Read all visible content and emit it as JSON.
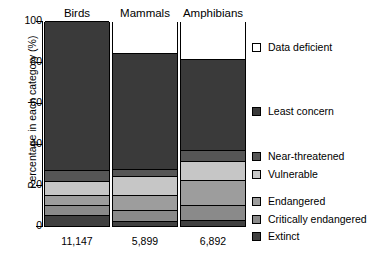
{
  "chart_data": {
    "type": "bar",
    "subtype": "stacked-percentage",
    "title": "",
    "xlabel": "",
    "ylabel": "Percentage in each category (%)",
    "ylim": [
      0,
      100
    ],
    "yticks": [
      "0",
      "20",
      "40",
      "60",
      "80",
      "100"
    ],
    "grid": false,
    "legend_position": "right",
    "categories": [
      "Birds",
      "Mammals",
      "Amphibians"
    ],
    "sample_sizes": [
      "11,147",
      "5,899",
      "6,892"
    ],
    "series": [
      {
        "name": "Data deficient",
        "color": "#ffffff",
        "values": [
          0.0,
          15.7,
          18.6
        ]
      },
      {
        "name": "Least concern",
        "color": "#3a3a3a",
        "values": [
          72.5,
          56.4,
          44.1
        ]
      },
      {
        "name": "Near-threatened",
        "color": "#565656",
        "values": [
          5.4,
          3.4,
          5.4
        ]
      },
      {
        "name": "Vulnerable",
        "color": "#c6c6c6",
        "values": [
          6.9,
          9.3,
          9.3
        ]
      },
      {
        "name": "Endangered",
        "color": "#9d9d9d",
        "values": [
          4.9,
          7.4,
          12.3
        ]
      },
      {
        "name": "Critically endangered",
        "color": "#8a8a8a",
        "values": [
          4.9,
          5.3,
          7.4
        ]
      },
      {
        "name": "Extinct",
        "color": "#404040",
        "values": [
          5.4,
          2.5,
          2.9
        ]
      }
    ]
  },
  "axis": {
    "ylabel": "Percentage in each category (%)",
    "ticks": [
      {
        "label": "100",
        "value": 100
      },
      {
        "label": "80",
        "value": 80
      },
      {
        "label": "60",
        "value": 60
      },
      {
        "label": "40",
        "value": 40
      },
      {
        "label": "20",
        "value": 20
      },
      {
        "label": "0",
        "value": 0
      }
    ]
  },
  "bars": [
    {
      "title": "Birds",
      "count": "11,147",
      "segments": [
        {
          "name": "Data deficient",
          "top": 100.0,
          "bottom": 100.0,
          "color": "#ffffff"
        },
        {
          "name": "Least concern",
          "top": 100.0,
          "bottom": 27.5,
          "color": "#3a3a3a"
        },
        {
          "name": "Near-threatened",
          "top": 27.5,
          "bottom": 22.1,
          "color": "#565656"
        },
        {
          "name": "Vulnerable",
          "top": 22.1,
          "bottom": 15.2,
          "color": "#c6c6c6"
        },
        {
          "name": "Endangered",
          "top": 15.2,
          "bottom": 10.3,
          "color": "#9d9d9d"
        },
        {
          "name": "Critically endangered",
          "top": 10.3,
          "bottom": 5.4,
          "color": "#8a8a8a"
        },
        {
          "name": "Extinct",
          "top": 5.4,
          "bottom": 0.0,
          "color": "#404040"
        }
      ]
    },
    {
      "title": "Mammals",
      "count": "5,899",
      "segments": [
        {
          "name": "Data deficient",
          "top": 100.0,
          "bottom": 84.3,
          "color": "#ffffff"
        },
        {
          "name": "Least concern",
          "top": 84.3,
          "bottom": 27.9,
          "color": "#3a3a3a"
        },
        {
          "name": "Near-threatened",
          "top": 27.9,
          "bottom": 24.5,
          "color": "#565656"
        },
        {
          "name": "Vulnerable",
          "top": 24.5,
          "bottom": 15.2,
          "color": "#c6c6c6"
        },
        {
          "name": "Endangered",
          "top": 15.2,
          "bottom": 7.8,
          "color": "#9d9d9d"
        },
        {
          "name": "Critically endangered",
          "top": 7.8,
          "bottom": 2.5,
          "color": "#8a8a8a"
        },
        {
          "name": "Extinct",
          "top": 2.5,
          "bottom": 0.0,
          "color": "#404040"
        }
      ]
    },
    {
      "title": "Amphibians",
      "count": "6,892",
      "segments": [
        {
          "name": "Data deficient",
          "top": 100.0,
          "bottom": 81.4,
          "color": "#ffffff"
        },
        {
          "name": "Least concern",
          "top": 81.4,
          "bottom": 37.3,
          "color": "#3a3a3a"
        },
        {
          "name": "Near-threatened",
          "top": 37.3,
          "bottom": 31.9,
          "color": "#565656"
        },
        {
          "name": "Vulnerable",
          "top": 31.9,
          "bottom": 22.5,
          "color": "#c6c6c6"
        },
        {
          "name": "Endangered",
          "top": 22.5,
          "bottom": 10.3,
          "color": "#9d9d9d"
        },
        {
          "name": "Critically endangered",
          "top": 10.3,
          "bottom": 2.9,
          "color": "#8a8a8a"
        },
        {
          "name": "Extinct",
          "top": 2.9,
          "bottom": 0.0,
          "color": "#404040"
        }
      ]
    }
  ],
  "legend": [
    {
      "label": "Data deficient",
      "color": "#ffffff",
      "top": 42
    },
    {
      "label": "Least concern",
      "color": "#3a3a3a",
      "top": 106
    },
    {
      "label": "Near-threatened",
      "color": "#565656",
      "top": 151
    },
    {
      "label": "Vulnerable",
      "color": "#c6c6c6",
      "top": 169
    },
    {
      "label": "Endangered",
      "color": "#9d9d9d",
      "top": 196
    },
    {
      "label": "Critically endangered",
      "color": "#8a8a8a",
      "top": 214
    },
    {
      "label": "Extinct",
      "color": "#404040",
      "top": 231
    }
  ]
}
